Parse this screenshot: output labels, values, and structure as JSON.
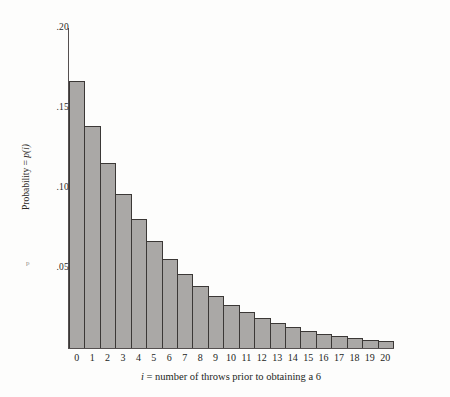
{
  "figure": {
    "background_color": "#fdfdfc",
    "bar_fill_color": "#aaa8a6",
    "bar_edge_color": "#3b3836",
    "axis_color": "#555050",
    "stray_mark": "p"
  },
  "chart_data": {
    "type": "bar",
    "title": "",
    "subtitle": "",
    "xlabel": "i = number of throws prior to obtaining a 6",
    "xlabel_italic_prefix": "i",
    "xlabel_rest": " = number of throws prior to obtaining a 6",
    "ylabel": "Probability = p(i)",
    "ylabel_prefix": "Probability = ",
    "ylabel_italic": "p(i)",
    "categories": [
      "0",
      "1",
      "2",
      "3",
      "4",
      "5",
      "6",
      "7",
      "8",
      "9",
      "10",
      "11",
      "12",
      "13",
      "14",
      "15",
      "16",
      "17",
      "18",
      "19",
      "20"
    ],
    "values": [
      0.1667,
      0.1389,
      0.1157,
      0.0964,
      0.0804,
      0.067,
      0.0558,
      0.0465,
      0.0388,
      0.0323,
      0.0269,
      0.0224,
      0.0187,
      0.0156,
      0.013,
      0.0108,
      0.009,
      0.0075,
      0.0063,
      0.0052,
      0.0043
    ],
    "ylim": [
      0,
      0.2
    ],
    "xlim_categories": [
      0,
      20
    ],
    "ytick_values": [
      0.2,
      0.15,
      0.1,
      0.05
    ],
    "ytick_labels": [
      ".20",
      ".15",
      ".10",
      ".05"
    ],
    "grid": false,
    "legend": null,
    "distribution": "geometric p(i) = (5/6)^i * (1/6)"
  }
}
